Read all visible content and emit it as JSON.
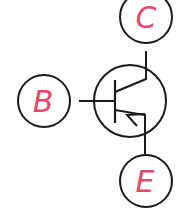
{
  "diagram": {
    "type": "PNP transistor symbol",
    "colors": {
      "line": "#1a1a1a",
      "label": "#e8466a",
      "background": "#ffffff"
    },
    "terminals": [
      {
        "id": "collector",
        "label": "C"
      },
      {
        "id": "base",
        "label": "B"
      },
      {
        "id": "emitter",
        "label": "E"
      }
    ]
  }
}
